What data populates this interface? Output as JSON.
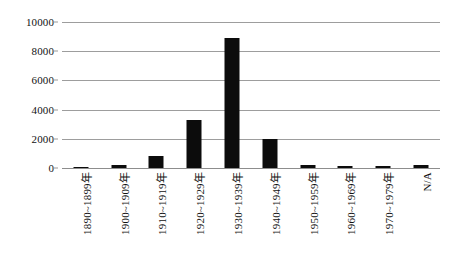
{
  "chart_data": {
    "type": "bar",
    "title": "",
    "subtitle": "",
    "xlabel": "",
    "ylabel": "",
    "categories": [
      "1890~1899年",
      "1900~1909年",
      "1910~1919年",
      "1920~1929年",
      "1930~1939年",
      "1940~1949年",
      "1950~1959年",
      "1960~1969年",
      "1970~1979年",
      "N/A"
    ],
    "values": [
      100,
      200,
      820,
      3280,
      8900,
      2000,
      200,
      130,
      130,
      180
    ],
    "ylim": [
      0,
      10000
    ],
    "yticks": [
      0,
      2000,
      4000,
      6000,
      8000,
      10000
    ],
    "ytick_labels": [
      "0",
      "2000",
      "4000",
      "6000",
      "8000",
      "10000"
    ],
    "grid": true,
    "legend": null,
    "legend_position": "none",
    "bar_color": "#0c0c0c",
    "gridline_color": "#9d9d9d",
    "background_color": "#ffffff",
    "text_color": "#111111",
    "x_label_rotation": 90
  }
}
